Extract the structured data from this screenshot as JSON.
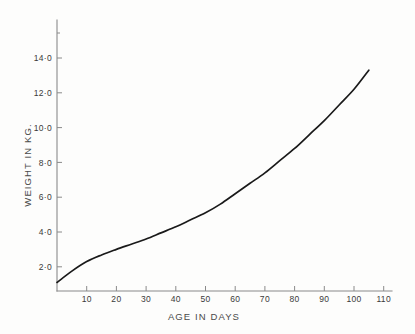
{
  "chart_data": {
    "type": "line",
    "title": "",
    "xlabel": "AGE IN DAYS",
    "ylabel": "WEIGHT IN KG.",
    "xlim": [
      0,
      113
    ],
    "ylim": [
      0,
      16.4
    ],
    "grid": false,
    "legend": null,
    "x_ticks": [
      10,
      20,
      30,
      40,
      50,
      60,
      70,
      80,
      90,
      100,
      110
    ],
    "x_tick_labels": [
      "10",
      "20",
      "30",
      "40",
      "50",
      "60",
      "70",
      "80",
      "90",
      "100",
      "110"
    ],
    "y_ticks": [
      2.0,
      4.0,
      6.0,
      8.0,
      10.0,
      12.0,
      14.0,
      16.0
    ],
    "y_tick_labels": [
      "2·0",
      "4·0",
      "6·0",
      "8·0",
      "10·0",
      "12·0",
      "14·0",
      ""
    ],
    "series": [
      {
        "name": "weight",
        "color": "#1a1a1a",
        "x": [
          0,
          5,
          10,
          15,
          20,
          25,
          30,
          35,
          40,
          45,
          50,
          55,
          60,
          65,
          70,
          75,
          80,
          85,
          90,
          95,
          100,
          105
        ],
        "values": [
          1.1,
          1.75,
          2.3,
          2.68,
          3.0,
          3.3,
          3.6,
          3.95,
          4.3,
          4.7,
          5.1,
          5.6,
          6.2,
          6.8,
          7.4,
          8.1,
          8.8,
          9.6,
          10.4,
          11.3,
          12.2,
          13.3
        ]
      }
    ]
  },
  "axes": {
    "x_title": "AGE IN DAYS",
    "y_title": "WEIGHT IN KG."
  },
  "colors": {
    "curve": "#1a1a1a",
    "axis": "#8a8a8a",
    "text": "#3a3a3a",
    "background": "#fdfdfc"
  }
}
